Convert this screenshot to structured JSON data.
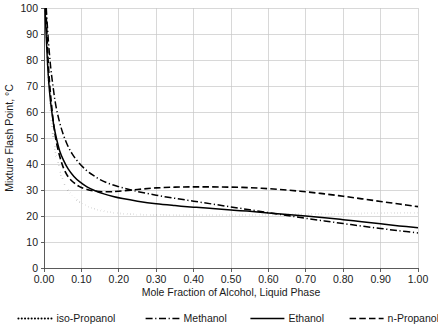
{
  "chart_data": {
    "type": "line",
    "title": "",
    "xlabel": "Mole Fraction of Alcohol, Liquid Phase",
    "ylabel": "Mixture Flash Point, °C",
    "xlim": [
      0.0,
      1.0
    ],
    "ylim": [
      0,
      100
    ],
    "grid": true,
    "legend_position": "bottom",
    "xticks": [
      "0.00",
      "0.10",
      "0.20",
      "0.30",
      "0.40",
      "0.50",
      "0.60",
      "0.70",
      "0.80",
      "0.90",
      "1.00"
    ],
    "xtick_values": [
      0.0,
      0.1,
      0.2,
      0.3,
      0.4,
      0.5,
      0.6,
      0.7,
      0.8,
      0.9,
      1.0
    ],
    "yticks": [
      "0",
      "10",
      "20",
      "30",
      "40",
      "50",
      "60",
      "70",
      "80",
      "90",
      "100"
    ],
    "ytick_values": [
      0,
      10,
      20,
      30,
      40,
      50,
      60,
      70,
      80,
      90,
      100
    ],
    "series": [
      {
        "name": "iso-Propanol",
        "style": "dotted",
        "x": [
          0.004,
          0.006,
          0.009,
          0.012,
          0.016,
          0.02,
          0.026,
          0.032,
          0.04,
          0.05,
          0.06,
          0.075,
          0.09,
          0.11,
          0.13,
          0.15,
          0.175,
          0.2,
          0.25,
          0.3,
          0.35,
          0.4,
          0.45,
          0.5,
          0.55,
          0.6,
          0.65,
          0.7,
          0.75,
          0.8,
          0.85,
          0.9,
          0.95,
          1.0
        ],
        "y": [
          100.0,
          92.0,
          82.0,
          73.0,
          64.0,
          57.0,
          49.0,
          44.0,
          38.5,
          34.0,
          31.0,
          28.0,
          26.0,
          24.2,
          23.0,
          22.2,
          21.5,
          21.0,
          20.6,
          20.4,
          20.3,
          20.3,
          20.3,
          20.3,
          20.4,
          20.5,
          20.6,
          20.7,
          20.8,
          20.9,
          21.0,
          21.1,
          21.2,
          21.3
        ]
      },
      {
        "name": "Methanol",
        "style": "dash-dot",
        "x": [
          0.006,
          0.009,
          0.013,
          0.018,
          0.024,
          0.031,
          0.04,
          0.05,
          0.062,
          0.075,
          0.09,
          0.11,
          0.13,
          0.15,
          0.175,
          0.2,
          0.225,
          0.25,
          0.3,
          0.35,
          0.4,
          0.45,
          0.5,
          0.55,
          0.6,
          0.65,
          0.7,
          0.75,
          0.8,
          0.85,
          0.9,
          0.95,
          1.0
        ],
        "y": [
          100.0,
          93.0,
          85.0,
          77.0,
          70.0,
          63.0,
          57.0,
          52.0,
          47.5,
          44.0,
          41.0,
          38.0,
          35.8,
          34.0,
          32.4,
          31.3,
          30.3,
          29.4,
          28.0,
          26.8,
          25.7,
          24.6,
          23.5,
          22.4,
          21.3,
          20.2,
          19.1,
          18.1,
          17.1,
          16.1,
          15.2,
          14.3,
          13.5
        ]
      },
      {
        "name": "Ethanol",
        "style": "solid",
        "x": [
          0.003,
          0.005,
          0.008,
          0.011,
          0.015,
          0.02,
          0.026,
          0.033,
          0.042,
          0.052,
          0.065,
          0.08,
          0.095,
          0.115,
          0.135,
          0.16,
          0.185,
          0.21,
          0.25,
          0.3,
          0.35,
          0.4,
          0.45,
          0.5,
          0.55,
          0.6,
          0.65,
          0.7,
          0.75,
          0.8,
          0.85,
          0.9,
          0.95,
          1.0
        ],
        "y": [
          100.0,
          92.0,
          83.0,
          75.0,
          67.5,
          61.0,
          55.0,
          50.0,
          45.0,
          41.5,
          38.0,
          35.2,
          33.2,
          31.2,
          29.8,
          28.5,
          27.5,
          26.7,
          25.7,
          24.7,
          24.0,
          23.4,
          22.9,
          22.3,
          21.8,
          21.2,
          20.6,
          20.0,
          19.3,
          18.6,
          17.8,
          17.0,
          16.2,
          15.5
        ]
      },
      {
        "name": "n-Propanol",
        "style": "dashed",
        "x": [
          0.005,
          0.008,
          0.011,
          0.015,
          0.02,
          0.026,
          0.033,
          0.042,
          0.052,
          0.065,
          0.08,
          0.095,
          0.115,
          0.14,
          0.17,
          0.2,
          0.25,
          0.3,
          0.35,
          0.4,
          0.45,
          0.5,
          0.55,
          0.6,
          0.65,
          0.7,
          0.75,
          0.8,
          0.85,
          0.9,
          0.95,
          1.0
        ],
        "y": [
          100.0,
          90.0,
          80.0,
          71.0,
          63.0,
          55.0,
          48.5,
          43.0,
          38.5,
          35.0,
          32.8,
          31.3,
          30.2,
          29.5,
          29.3,
          29.5,
          30.2,
          30.8,
          31.1,
          31.2,
          31.2,
          31.1,
          30.9,
          30.5,
          30.0,
          29.3,
          28.5,
          27.6,
          26.6,
          25.6,
          24.6,
          23.6
        ]
      }
    ]
  },
  "legend": {
    "items": [
      {
        "label": "iso-Propanol",
        "style": "dotted"
      },
      {
        "label": "Methanol",
        "style": "dash-dot"
      },
      {
        "label": "Ethanol",
        "style": "solid"
      },
      {
        "label": "n-Propanol",
        "style": "dashed"
      }
    ]
  },
  "colors": {
    "series": "#000000",
    "grid": "#c8c8c8",
    "axis": "#4d4d4d",
    "text": "#1a1a1a",
    "background": "#ffffff"
  }
}
